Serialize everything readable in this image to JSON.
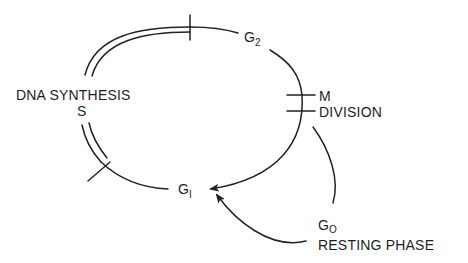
{
  "diagram": {
    "type": "cell-cycle",
    "colors": {
      "ink": "#222222",
      "background": "#ffffff"
    },
    "phases": [
      {
        "id": "g1",
        "label": "G",
        "subscript": "1"
      },
      {
        "id": "s",
        "label": "S",
        "description": "DNA SYNTHESIS"
      },
      {
        "id": "g2",
        "label": "G",
        "subscript": "2"
      },
      {
        "id": "m",
        "label": "M",
        "description": "DIVISION"
      },
      {
        "id": "g0",
        "label": "G",
        "subscript": "O",
        "description": "RESTING PHASE"
      }
    ],
    "arrows": [
      {
        "from": "m",
        "to": "g1"
      },
      {
        "from": "g0",
        "to": "g1"
      }
    ]
  },
  "labels": {
    "dna_synthesis": "DNA SYNTHESIS",
    "s": "S",
    "g2_main": "G",
    "g2_sub": "2",
    "m": "M",
    "division": "DIVISION",
    "g1_main": "G",
    "g1_sub": "I",
    "g0_main": "G",
    "g0_sub": "O",
    "resting_phase": "RESTING PHASE"
  }
}
